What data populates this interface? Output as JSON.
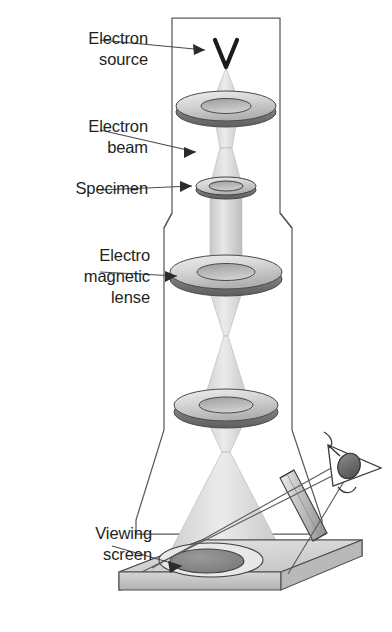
{
  "diagram": {
    "labels": [
      {
        "id": "electron-source",
        "text": "Electron\nsource"
      },
      {
        "id": "electron-beam",
        "text": "Electron\nbeam"
      },
      {
        "id": "specimen",
        "text": "Specimen"
      },
      {
        "id": "lens",
        "text": "Electro\nmagnetic\nlense"
      },
      {
        "id": "viewing-screen",
        "text": "Viewing\nscreen"
      }
    ],
    "components": {
      "electron_source": "v-filament",
      "lens_count": 3,
      "specimen": "aperture-ring",
      "viewing_port": "angled-window",
      "observer": "eye",
      "screen": "flat-slab-with-image-disc"
    },
    "colors": {
      "outline": "#4d4d4d",
      "text": "#231f20",
      "beam_light": "#e2e2e2",
      "beam_mid": "#c9c9c9",
      "lens_top": "#d2d2d2",
      "lens_dark": "#6e6e6e",
      "lens_inner": "#b4b4b4",
      "screen_top": "#d9d9d9",
      "screen_side": "#c2c2c2",
      "screen_disc": "#8a8a8a",
      "eye_pupil": "#2b2b2b"
    }
  }
}
